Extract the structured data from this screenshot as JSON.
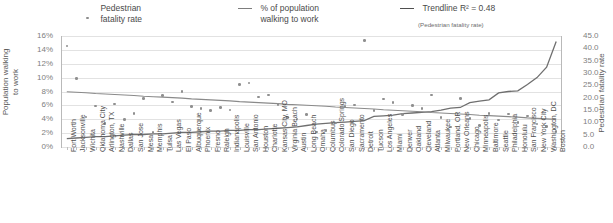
{
  "legend": {
    "items": [
      {
        "name": "pedestrian-fatality-rate",
        "marker": "dot",
        "label": "Pedestrian\nfatality rate",
        "sub": ""
      },
      {
        "name": "percent-walking-to-work",
        "marker": "line",
        "label": "% of population\nwalking to work",
        "sub": ""
      },
      {
        "name": "trendline",
        "marker": "line-dark",
        "label": "Trendline R² = 0.48",
        "sub": "(Pedestrian fatality rate)"
      }
    ]
  },
  "axes": {
    "y_left_title": "Population walking\nto work",
    "y_right_title": "Pedestrian fatality rate",
    "y_left_ticks": [
      "16%",
      "14%",
      "12%",
      "10%",
      "8%",
      "6%",
      "4%",
      "2%",
      "0%"
    ],
    "y_right_ticks": [
      "45.0",
      "40.0",
      "35.0",
      "30.0",
      "25.0",
      "20.0",
      "15.0",
      "10.0",
      "5.0",
      "0.0"
    ]
  },
  "chart_data": {
    "type": "scatter",
    "title": "",
    "xlabel": "",
    "ylabel": "Population walking to work",
    "ylabel_secondary": "Pedestrian fatality rate",
    "ylim": [
      0,
      16
    ],
    "ylim_secondary": [
      0,
      45
    ],
    "grid": true,
    "legend_position": "top",
    "categories": [
      "Fort Worth",
      "Jacksonville",
      "Wichita",
      "Oklahoma City",
      "Arlington, TX",
      "Nashville",
      "Dallas",
      "San Jose",
      "Mesa",
      "Memphis",
      "Tulsa",
      "Las Vegas",
      "El Paso",
      "Albuquerque",
      "Phoenix",
      "Fresno",
      "Raleigh",
      "Indianapolis",
      "Louisville",
      "San Antonio",
      "Houston",
      "Charlotte",
      "Kansas City, MO",
      "Virginia Beach",
      "Austin",
      "Long Beach",
      "Omaha",
      "Columbus",
      "Colorado Springs",
      "San Diego",
      "Sacramento",
      "Detroit",
      "Tucson",
      "Los Angeles",
      "Miami",
      "Denver",
      "Oakland",
      "Cleveland",
      "Atlanta",
      "Milwaukee",
      "Portland, OR",
      "New Orleans",
      "Chicago",
      "Minneapolis",
      "Baltimore",
      "Seattle",
      "Philadelphia",
      "Honolulu",
      "San Francisco",
      "New York City",
      "Washington, DC",
      "Boston"
    ],
    "series": [
      {
        "name": "Pedestrian fatality rate",
        "axis": "secondary",
        "type": "scatter",
        "values": [
          41.0,
          27.8,
          12.2,
          16.7,
          9.6,
          17.5,
          11.2,
          13.5,
          19.6,
          5.8,
          20.8,
          18.3,
          22.6,
          16.3,
          15.6,
          14.9,
          16.1,
          15.0,
          25.4,
          25.9,
          20.3,
          21.0,
          17.2,
          12.0,
          11.4,
          13.2,
          6.1,
          6.6,
          9.8,
          16.4,
          17.1,
          43.1,
          14.9,
          19.4,
          18.1,
          13.1,
          16.8,
          15.7,
          21.0,
          12.0,
          8.1,
          19.6,
          11.5,
          8.7,
          13.7,
          11.0,
          13.4,
          9.9,
          12.6,
          9.4,
          8.2,
          6.3
        ]
      },
      {
        "name": "% of population walking to work",
        "axis": "primary",
        "type": "line",
        "values": [
          1.2,
          1.3,
          1.4,
          1.5,
          1.5,
          1.6,
          1.7,
          1.8,
          1.8,
          1.9,
          1.9,
          2.0,
          2.1,
          2.1,
          2.2,
          2.3,
          2.3,
          2.4,
          2.4,
          2.5,
          2.5,
          2.6,
          2.7,
          2.8,
          2.9,
          3.1,
          3.3,
          3.4,
          3.5,
          3.6,
          3.7,
          3.8,
          4.4,
          4.5,
          4.6,
          4.8,
          4.9,
          5.0,
          5.1,
          5.3,
          5.6,
          5.7,
          6.4,
          6.6,
          6.8,
          7.8,
          8.0,
          8.1,
          9.0,
          10.0,
          11.5,
          15.2
        ]
      },
      {
        "name": "Trendline (Pedestrian fatality rate)",
        "axis": "secondary",
        "type": "line",
        "r_squared": 0.48,
        "values": [
          22.4,
          22.2,
          22.0,
          21.7,
          21.5,
          21.3,
          21.1,
          20.9,
          20.6,
          20.4,
          20.2,
          20.0,
          19.8,
          19.5,
          19.3,
          19.1,
          18.9,
          18.7,
          18.4,
          18.2,
          18.0,
          17.8,
          17.6,
          17.3,
          17.1,
          16.9,
          16.7,
          16.5,
          16.2,
          16.0,
          15.8,
          15.6,
          15.4,
          15.1,
          14.9,
          14.7,
          14.5,
          14.3,
          14.0,
          13.8,
          13.6,
          13.4,
          13.2,
          12.9,
          12.7,
          12.5,
          12.3,
          12.1,
          11.8,
          11.6,
          11.4,
          11.2
        ]
      }
    ]
  }
}
